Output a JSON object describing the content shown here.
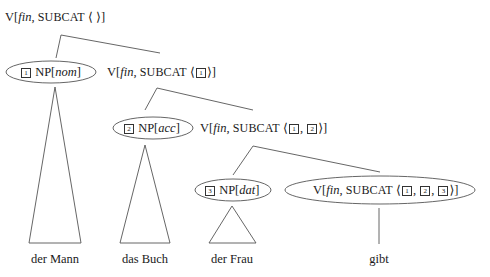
{
  "diagram": {
    "type": "hpsg-tree",
    "nodes": {
      "root": {
        "cat": "V",
        "head": "fin",
        "feature": "SUBCAT",
        "list": "⟨ ⟩"
      },
      "np1": {
        "tag": "1",
        "cat": "NP",
        "case": "nom"
      },
      "v1": {
        "cat": "V",
        "head": "fin",
        "feature": "SUBCAT",
        "tags": [
          "1"
        ]
      },
      "np2": {
        "tag": "2",
        "cat": "NP",
        "case": "acc"
      },
      "v2": {
        "cat": "V",
        "head": "fin",
        "feature": "SUBCAT",
        "tags": [
          "1",
          "2"
        ]
      },
      "np3": {
        "tag": "3",
        "cat": "NP",
        "case": "dat"
      },
      "v3": {
        "cat": "V",
        "head": "fin",
        "feature": "SUBCAT",
        "tags": [
          "1",
          "2",
          "3"
        ]
      }
    },
    "words": [
      "der Mann",
      "das Buch",
      "der Frau",
      "gibt"
    ],
    "stroke_color": "#555555"
  }
}
